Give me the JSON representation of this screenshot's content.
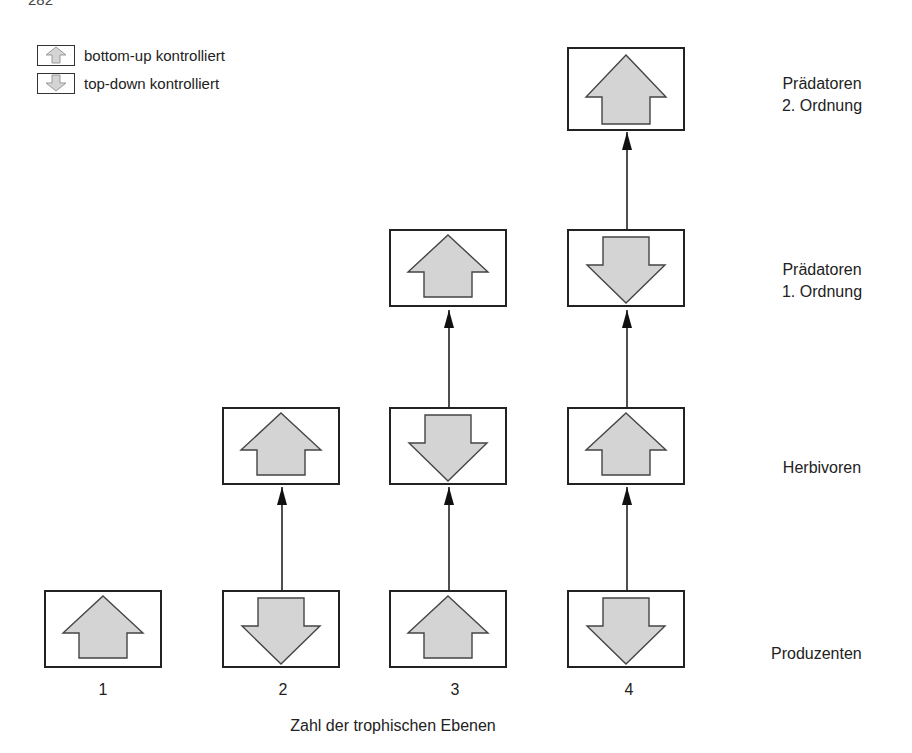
{
  "page_number": "282",
  "legend": [
    {
      "icon": "arrow-up-icon",
      "label": "bottom-up kontrolliert"
    },
    {
      "icon": "arrow-down-icon",
      "label": "top-down kontrolliert"
    }
  ],
  "levels": [
    {
      "key": "praed2",
      "label": "Prädatoren\n2. Ordnung"
    },
    {
      "key": "praed1",
      "label": "Prädatoren\n1. Ordnung"
    },
    {
      "key": "herb",
      "label": "Herbivoren"
    },
    {
      "key": "prod",
      "label": "Produzenten"
    }
  ],
  "columns": [
    {
      "tick": "1",
      "stack": {
        "prod": "up"
      }
    },
    {
      "tick": "2",
      "stack": {
        "prod": "down",
        "herb": "up"
      }
    },
    {
      "tick": "3",
      "stack": {
        "prod": "up",
        "herb": "down",
        "praed1": "up"
      }
    },
    {
      "tick": "4",
      "stack": {
        "prod": "down",
        "herb": "up",
        "praed1": "down",
        "praed2": "up"
      }
    }
  ],
  "x_axis_label": "Zahl der trophischen Ebenen",
  "colors": {
    "arrow_fill": "#d4d4d4",
    "stroke": "#222222"
  }
}
